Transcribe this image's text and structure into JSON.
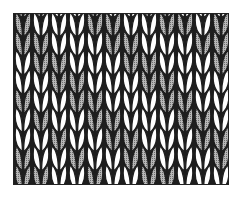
{
  "illustration": {
    "subject": "stockinette knit stitch swatch",
    "columns": 12,
    "rows": 9,
    "colors": {
      "outline": "#1e1e1e",
      "light": "#ffffff",
      "shaded": "#9a9a9a",
      "background": "#ffffff"
    },
    "pattern": [
      "DLLLDDLLDDLD",
      "DDLLLDDLLLDD",
      "LDDLLLDDLLLD",
      "LLDDLLLDDLLL",
      "DLLDDLLLDDLL",
      "LDLLDDLLLDDL",
      "LLDLLDDLLLDD",
      "DLLDLLDDLLLD",
      "DDLLDLLDDLLL"
    ]
  }
}
